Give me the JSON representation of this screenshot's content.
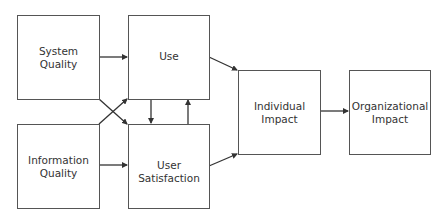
{
  "diagram": {
    "nodes": {
      "system_quality": {
        "line1": "System",
        "line2": "Quality"
      },
      "information_quality": {
        "line1": "Information",
        "line2": "Quality"
      },
      "use": {
        "line1": "Use",
        "line2": ""
      },
      "user_satisfaction": {
        "line1": "User",
        "line2": "Satisfaction"
      },
      "individual_impact": {
        "line1": "Individual",
        "line2": "Impact"
      },
      "organizational_impact": {
        "line1": "Organizational",
        "line2": "Impact"
      }
    },
    "edges": [
      {
        "from": "System Quality",
        "to": "Use"
      },
      {
        "from": "System Quality",
        "to": "User Satisfaction"
      },
      {
        "from": "Information Quality",
        "to": "Use"
      },
      {
        "from": "Information Quality",
        "to": "User Satisfaction"
      },
      {
        "from": "Use",
        "to": "User Satisfaction"
      },
      {
        "from": "User Satisfaction",
        "to": "Use"
      },
      {
        "from": "Use",
        "to": "Individual Impact"
      },
      {
        "from": "User Satisfaction",
        "to": "Individual Impact"
      },
      {
        "from": "Individual Impact",
        "to": "Organizational Impact"
      }
    ],
    "colors": {
      "stroke": "#333333",
      "text": "#333333",
      "background": "#ffffff"
    }
  }
}
